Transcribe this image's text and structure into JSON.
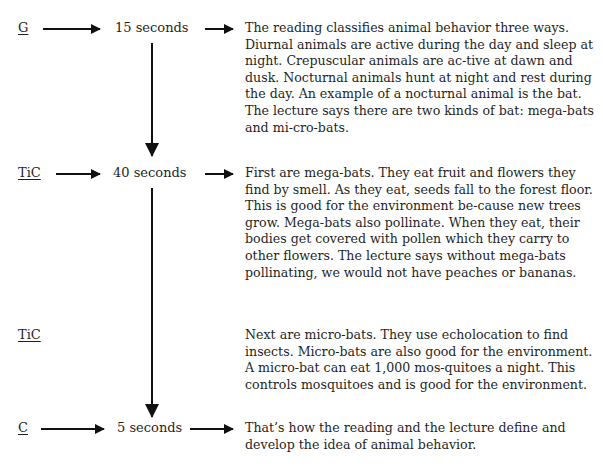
{
  "rows": [
    {
      "label": "G",
      "time": "15 seconds",
      "text": "The reading classifies animal behavior three ways. Diurnal animals are active during the day and sleep at night. Crepuscular animals are ac-tive at dawn and dusk. Nocturnal animals hunt at night and rest during the day. An example of a nocturnal animal is the bat. The lecture says there are two kinds of bat: mega-bats and mi-cro-bats."
    },
    {
      "label": "TiC",
      "time": "40 seconds",
      "text": "First are mega-bats. They eat fruit and flowers they find by smell. As they eat, seeds fall to the forest floor. This is good for the environment be-cause new trees grow. Mega-bats also pollinate. When they eat, their bodies get covered with pollen which they carry to other flowers. The lecture says without mega-bats pollinating, we would not have peaches or bananas."
    },
    {
      "label": "TiC",
      "time": "",
      "text": "Next are micro-bats. They use echolocation to find insects. Micro-bats are also good for the environment. A micro-bat can eat 1,000 mos-quitoes a night. This controls mosquitoes and is good for the environment."
    },
    {
      "label": "C",
      "time": "5 seconds",
      "text": "That’s how the reading and the lecture define and develop the idea of animal behavior."
    }
  ]
}
